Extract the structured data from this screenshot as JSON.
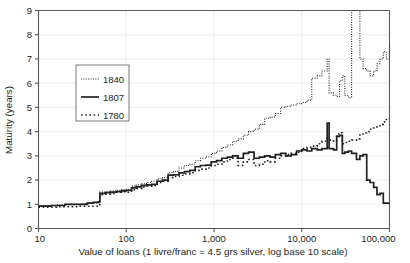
{
  "chart_data": {
    "type": "line",
    "title": "",
    "xlabel": "Value of loans  (1 livre/franc = 4.5 grs silver, log base 10 scale)",
    "ylabel": "Maturity (years)",
    "xscale": "log",
    "xlim": [
      10,
      100000
    ],
    "ylim": [
      0,
      9
    ],
    "xticks": [
      10,
      100,
      1000,
      10000,
      100000
    ],
    "xticklabels": [
      "10",
      "100",
      "1,000",
      "10,000",
      "100,000"
    ],
    "yticks": [
      0,
      1,
      2,
      3,
      4,
      5,
      6,
      7,
      8,
      9
    ],
    "yticklabels": [
      "0",
      "1",
      "2",
      "3",
      "4",
      "5",
      "6",
      "7",
      "8",
      "9"
    ],
    "grid": true,
    "grid_color": "#f2f2f2",
    "axis_color": "#58595b",
    "line_color": "#231f20",
    "legend_position": "upper-left-inside",
    "legend_entries": [
      {
        "label": "1840",
        "style": "fine-dotted"
      },
      {
        "label": "1807",
        "style": "solid"
      },
      {
        "label": "1780",
        "style": "coarse-dotted"
      }
    ],
    "series": [
      {
        "name": "1840",
        "style": "fine-dotted",
        "points": [
          [
            10,
            0.95
          ],
          [
            12,
            0.95
          ],
          [
            14,
            0.95
          ],
          [
            16,
            0.98
          ],
          [
            18,
            0.98
          ],
          [
            20,
            1.0
          ],
          [
            24,
            1.0
          ],
          [
            28,
            1.0
          ],
          [
            32,
            1.02
          ],
          [
            36,
            1.05
          ],
          [
            42,
            1.05
          ],
          [
            48,
            1.05
          ],
          [
            50,
            1.5
          ],
          [
            58,
            1.52
          ],
          [
            66,
            1.55
          ],
          [
            76,
            1.58
          ],
          [
            88,
            1.6
          ],
          [
            100,
            1.62
          ],
          [
            115,
            1.75
          ],
          [
            130,
            1.8
          ],
          [
            150,
            1.85
          ],
          [
            170,
            1.9
          ],
          [
            195,
            1.95
          ],
          [
            225,
            2.05
          ],
          [
            260,
            2.1
          ],
          [
            300,
            2.3
          ],
          [
            345,
            2.35
          ],
          [
            400,
            2.5
          ],
          [
            460,
            2.6
          ],
          [
            530,
            2.65
          ],
          [
            610,
            2.8
          ],
          [
            700,
            2.9
          ],
          [
            810,
            2.95
          ],
          [
            930,
            3.1
          ],
          [
            1070,
            3.2
          ],
          [
            1230,
            3.35
          ],
          [
            1420,
            3.45
          ],
          [
            1630,
            3.6
          ],
          [
            1880,
            3.7
          ],
          [
            2160,
            3.85
          ],
          [
            2480,
            4.0
          ],
          [
            2860,
            4.1
          ],
          [
            3290,
            4.3
          ],
          [
            3780,
            4.55
          ],
          [
            4350,
            4.6
          ],
          [
            5000,
            4.75
          ],
          [
            5750,
            5.0
          ],
          [
            6600,
            5.05
          ],
          [
            7600,
            5.1
          ],
          [
            8750,
            5.15
          ],
          [
            10000,
            5.2
          ],
          [
            11500,
            5.3
          ],
          [
            13000,
            6.2
          ],
          [
            15000,
            6.3
          ],
          [
            17000,
            6.5
          ],
          [
            19500,
            7.0
          ],
          [
            20500,
            5.6
          ],
          [
            23000,
            5.5
          ],
          [
            25000,
            5.45
          ],
          [
            27000,
            6.1
          ],
          [
            29000,
            6.3
          ],
          [
            31000,
            5.5
          ],
          [
            34000,
            5.4
          ],
          [
            37000,
            9.0
          ],
          [
            42000,
            9.0
          ],
          [
            46000,
            7.0
          ],
          [
            50000,
            6.6
          ],
          [
            55000,
            6.5
          ],
          [
            60000,
            6.3
          ],
          [
            66000,
            6.5
          ],
          [
            72000,
            6.8
          ],
          [
            78000,
            7.0
          ],
          [
            85000,
            7.3
          ],
          [
            92000,
            7.0
          ],
          [
            100000,
            7.6
          ]
        ]
      },
      {
        "name": "1807",
        "style": "solid",
        "points": [
          [
            10,
            0.92
          ],
          [
            12,
            0.92
          ],
          [
            14,
            0.95
          ],
          [
            16,
            0.95
          ],
          [
            18,
            0.95
          ],
          [
            20,
            1.0
          ],
          [
            24,
            1.0
          ],
          [
            28,
            1.0
          ],
          [
            32,
            1.0
          ],
          [
            36,
            1.05
          ],
          [
            42,
            1.08
          ],
          [
            48,
            1.1
          ],
          [
            50,
            1.45
          ],
          [
            58,
            1.48
          ],
          [
            66,
            1.5
          ],
          [
            76,
            1.52
          ],
          [
            88,
            1.55
          ],
          [
            100,
            1.58
          ],
          [
            115,
            1.68
          ],
          [
            130,
            1.72
          ],
          [
            150,
            1.78
          ],
          [
            170,
            1.8
          ],
          [
            195,
            1.82
          ],
          [
            225,
            1.95
          ],
          [
            260,
            2.0
          ],
          [
            300,
            2.2
          ],
          [
            345,
            2.22
          ],
          [
            400,
            2.3
          ],
          [
            460,
            2.35
          ],
          [
            530,
            2.4
          ],
          [
            610,
            2.55
          ],
          [
            700,
            2.6
          ],
          [
            810,
            2.62
          ],
          [
            930,
            2.75
          ],
          [
            1070,
            2.8
          ],
          [
            1230,
            2.9
          ],
          [
            1420,
            2.95
          ],
          [
            1630,
            3.0
          ],
          [
            1880,
            2.9
          ],
          [
            2160,
            3.1
          ],
          [
            2480,
            3.15
          ],
          [
            2860,
            2.9
          ],
          [
            3290,
            2.95
          ],
          [
            3780,
            3.0
          ],
          [
            4350,
            2.95
          ],
          [
            5000,
            3.05
          ],
          [
            5750,
            3.1
          ],
          [
            6600,
            3.0
          ],
          [
            7600,
            3.05
          ],
          [
            8750,
            3.2
          ],
          [
            10000,
            3.25
          ],
          [
            11500,
            3.2
          ],
          [
            13000,
            3.3
          ],
          [
            15000,
            3.25
          ],
          [
            17000,
            3.3
          ],
          [
            19500,
            4.35
          ],
          [
            20500,
            3.3
          ],
          [
            23000,
            3.25
          ],
          [
            25000,
            3.8
          ],
          [
            27000,
            3.85
          ],
          [
            29000,
            3.1
          ],
          [
            31000,
            3.15
          ],
          [
            34000,
            3.2
          ],
          [
            37000,
            3.1
          ],
          [
            42000,
            2.85
          ],
          [
            46000,
            3.0
          ],
          [
            50000,
            3.05
          ],
          [
            55000,
            2.0
          ],
          [
            60000,
            1.9
          ],
          [
            66000,
            1.7
          ],
          [
            72000,
            1.4
          ],
          [
            78000,
            1.45
          ],
          [
            85000,
            1.05
          ],
          [
            92000,
            1.05
          ],
          [
            100000,
            1.0
          ]
        ]
      },
      {
        "name": "1780",
        "style": "coarse-dotted",
        "points": [
          [
            10,
            0.88
          ],
          [
            12,
            0.88
          ],
          [
            14,
            0.88
          ],
          [
            16,
            0.9
          ],
          [
            18,
            0.9
          ],
          [
            20,
            0.9
          ],
          [
            24,
            0.9
          ],
          [
            28,
            0.92
          ],
          [
            32,
            0.92
          ],
          [
            36,
            0.92
          ],
          [
            42,
            0.92
          ],
          [
            48,
            0.92
          ],
          [
            50,
            1.4
          ],
          [
            58,
            1.42
          ],
          [
            66,
            1.45
          ],
          [
            76,
            1.5
          ],
          [
            88,
            1.52
          ],
          [
            100,
            1.5
          ],
          [
            115,
            1.6
          ],
          [
            130,
            1.65
          ],
          [
            150,
            1.72
          ],
          [
            170,
            1.75
          ],
          [
            195,
            1.78
          ],
          [
            225,
            1.9
          ],
          [
            260,
            1.95
          ],
          [
            300,
            2.1
          ],
          [
            345,
            2.15
          ],
          [
            400,
            2.2
          ],
          [
            460,
            2.25
          ],
          [
            530,
            2.3
          ],
          [
            610,
            2.4
          ],
          [
            700,
            2.45
          ],
          [
            810,
            2.5
          ],
          [
            930,
            2.6
          ],
          [
            1070,
            2.65
          ],
          [
            1230,
            2.75
          ],
          [
            1420,
            2.85
          ],
          [
            1630,
            2.9
          ],
          [
            1880,
            2.6
          ],
          [
            2160,
            2.75
          ],
          [
            2480,
            2.85
          ],
          [
            2860,
            2.6
          ],
          [
            3290,
            2.65
          ],
          [
            3780,
            2.8
          ],
          [
            4350,
            2.75
          ],
          [
            5000,
            2.9
          ],
          [
            5750,
            3.0
          ],
          [
            6600,
            3.05
          ],
          [
            7600,
            3.1
          ],
          [
            8750,
            3.15
          ],
          [
            10000,
            3.3
          ],
          [
            11500,
            3.35
          ],
          [
            13000,
            3.4
          ],
          [
            15000,
            3.5
          ],
          [
            17000,
            3.6
          ],
          [
            19500,
            3.7
          ],
          [
            20500,
            3.65
          ],
          [
            23000,
            3.6
          ],
          [
            25000,
            3.9
          ],
          [
            27000,
            3.95
          ],
          [
            29000,
            3.5
          ],
          [
            31000,
            3.55
          ],
          [
            34000,
            3.6
          ],
          [
            37000,
            3.65
          ],
          [
            42000,
            3.7
          ],
          [
            46000,
            3.9
          ],
          [
            50000,
            3.95
          ],
          [
            55000,
            4.0
          ],
          [
            60000,
            4.1
          ],
          [
            66000,
            4.15
          ],
          [
            72000,
            4.2
          ],
          [
            78000,
            4.3
          ],
          [
            85000,
            4.4
          ],
          [
            92000,
            4.5
          ],
          [
            100000,
            4.55
          ]
        ]
      }
    ]
  }
}
